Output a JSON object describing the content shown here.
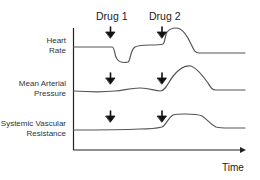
{
  "diagram": {
    "type": "physiological-response-timeline",
    "drugs": [
      {
        "label": "Drug 1",
        "arrow": "down-arrow"
      },
      {
        "label": "Drug 2",
        "arrow": "down-arrow"
      }
    ],
    "traces": [
      {
        "label_line1": "Heart",
        "label_line2": "Rate",
        "response_drug1": "decrease then partial recovery",
        "response_drug2": "sharp increase then return to baseline"
      },
      {
        "label_line1": "Mean Arterial",
        "label_line2": "Pressure",
        "response_drug1": "slight change",
        "response_drug2": "increase then return to baseline"
      },
      {
        "label_line1": "Systemic Vascular",
        "label_line2": "Resistance",
        "response_drug1": "no change",
        "response_drug2": "increase plateau then return to baseline"
      }
    ],
    "x_axis_label": "Time",
    "colors": {
      "trace": "#555555",
      "axis": "#222222",
      "arrow": "#111111",
      "text": "#333333"
    }
  }
}
